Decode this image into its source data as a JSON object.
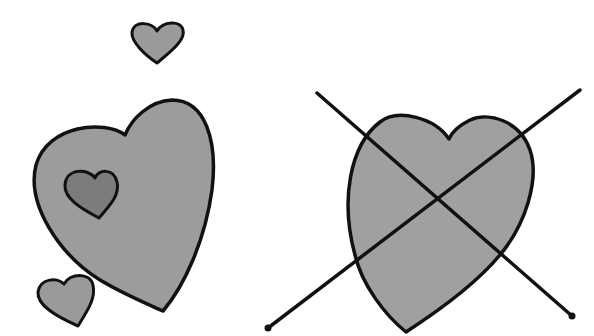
{
  "illustration": {
    "description": "Watercolor ink drawing: group of hearts on left, crossed-out heart on right",
    "colors": {
      "background": "#ffffff",
      "heart_fill": "#9a9a9a",
      "inner_heart_fill": "#7c7c7c",
      "outline": "#111111"
    },
    "left_group": {
      "hearts": [
        "small-top-heart",
        "large-heart",
        "inner-heart",
        "small-bottom-heart"
      ]
    },
    "right_group": {
      "hearts": [
        "crossed-out-heart"
      ],
      "cross": "x-mark"
    }
  }
}
